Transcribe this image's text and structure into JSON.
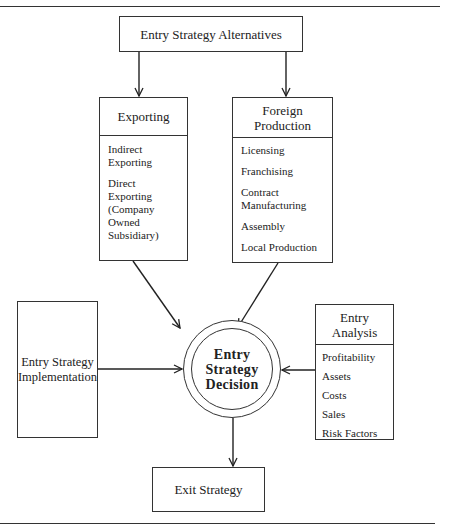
{
  "diagram": {
    "title": "Entry Strategy Alternatives",
    "nodes": {
      "alternatives": {
        "label": "Entry Strategy Alternatives"
      },
      "exporting": {
        "header": "Exporting",
        "items": [
          "Indirect Exporting",
          "Direct Exporting (Company Owned Subsidiary)"
        ]
      },
      "foreign_production": {
        "header": "Foreign Production",
        "items": [
          "Licensing",
          "Franchising",
          "Contract Manufacturing",
          "Assembly",
          "Local Production"
        ]
      },
      "implementation": {
        "label": "Entry Strategy Implementation"
      },
      "decision": {
        "label": "Entry Strategy Decision"
      },
      "analysis": {
        "header": "Entry Analysis",
        "items": [
          "Profitability",
          "Assets",
          "Costs",
          "Sales",
          "Risk Factors"
        ]
      },
      "exit": {
        "label": "Exit Strategy"
      }
    },
    "edges": [
      {
        "from": "alternatives",
        "to": "exporting"
      },
      {
        "from": "alternatives",
        "to": "foreign_production"
      },
      {
        "from": "exporting",
        "to": "decision"
      },
      {
        "from": "foreign_production",
        "to": "decision"
      },
      {
        "from": "implementation",
        "to": "decision"
      },
      {
        "from": "analysis",
        "to": "decision"
      },
      {
        "from": "decision",
        "to": "exit"
      }
    ],
    "colors": {
      "line": "#333333",
      "background": "#ffffff"
    }
  }
}
